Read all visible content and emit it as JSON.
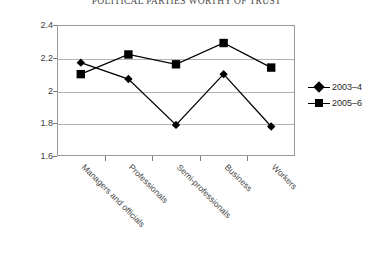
{
  "chart_data": {
    "type": "line",
    "title": "POLITICAL PARTIES WORTHY OF TRUST",
    "xlabel": "",
    "ylabel": "",
    "ylim": [
      1.6,
      2.4
    ],
    "ytick_labels": [
      "2.4",
      "2.2",
      "2",
      "1.8",
      "1.6"
    ],
    "yticks": [
      2.4,
      2.2,
      2.0,
      1.8,
      1.6
    ],
    "grid": true,
    "legend_position": "right",
    "categories": [
      "Managers and officials",
      "Professionals",
      "Semi-professionals",
      "Business",
      "Workers"
    ],
    "series": [
      {
        "name": "2003–4",
        "marker": "diamond",
        "color": "#000000",
        "values": [
          2.17,
          2.07,
          1.79,
          2.1,
          1.78
        ]
      },
      {
        "name": "2005–6",
        "marker": "square",
        "color": "#000000",
        "values": [
          2.1,
          2.22,
          2.16,
          2.29,
          2.14
        ]
      }
    ]
  },
  "legend": {
    "items": [
      {
        "label": "2003–4",
        "marker": "diamond-marker"
      },
      {
        "label": "2005–6",
        "marker": "square-marker"
      }
    ]
  }
}
